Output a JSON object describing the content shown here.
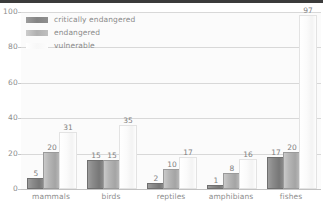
{
  "chart_data": {
    "type": "bar",
    "title": "",
    "subtitle": "",
    "xlabel": "",
    "ylabel": "",
    "categories": [
      "mammals",
      "birds",
      "reptiles",
      "amphibians",
      "fishes"
    ],
    "series": [
      {
        "name": "critically endangered",
        "color": "#848484",
        "values": [
          5,
          15,
          2,
          1,
          17
        ]
      },
      {
        "name": "endangered",
        "color": "#b0b0b0",
        "values": [
          20,
          15,
          10,
          8,
          20
        ]
      },
      {
        "name": "vulnerable",
        "color": "#fafafa",
        "values": [
          31,
          35,
          17,
          16,
          97
        ]
      }
    ],
    "ylim": [
      0,
      100
    ],
    "yticks": [
      0,
      20,
      40,
      60,
      80,
      100
    ],
    "ytick_labels": [
      "0",
      "20",
      "40",
      "60",
      "80",
      "100"
    ],
    "grid": true,
    "legend_position": "top-left",
    "value_labels": true
  },
  "legend": {
    "items": [
      {
        "label": "critically endangered",
        "swatch": "crit"
      },
      {
        "label": "endangered",
        "swatch": "endg"
      },
      {
        "label": "vulnerable",
        "swatch": "vuln"
      }
    ]
  }
}
